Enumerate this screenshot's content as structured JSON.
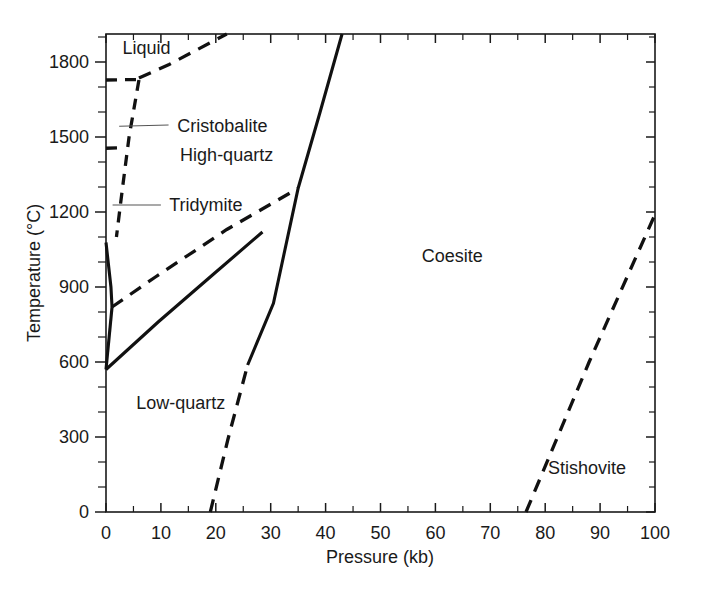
{
  "chart_data": {
    "type": "line",
    "title": "",
    "xlabel": "Pressure (kb)",
    "ylabel": "Temperature (°C)",
    "xlim": [
      0,
      100
    ],
    "ylim": [
      0,
      1912
    ],
    "grid": false,
    "legend": "none",
    "x_ticks": [
      0,
      10,
      20,
      30,
      40,
      50,
      60,
      70,
      80,
      90,
      100
    ],
    "x_tick_labels": [
      "0",
      "10",
      "20",
      "30",
      "40",
      "50",
      "60",
      "70",
      "80",
      "90",
      "100"
    ],
    "x_minor_step": 5,
    "y_ticks": [
      0,
      300,
      600,
      900,
      1200,
      1500,
      1800
    ],
    "y_tick_labels": [
      "0",
      "300",
      "600",
      "900",
      "1200",
      "1500",
      "1800"
    ],
    "y_minor_step": 100,
    "field_labels": [
      {
        "name": "Liquid",
        "text": "Liquid",
        "x": 3.0,
        "y": 1855
      },
      {
        "name": "Cristobalite",
        "text": "Cristobalite",
        "x": 13.0,
        "y": 1543
      },
      {
        "name": "High-quartz",
        "text": "High-quartz",
        "x": 13.5,
        "y": 1430
      },
      {
        "name": "Tridymite",
        "text": "Tridymite",
        "x": 11.5,
        "y": 1228
      },
      {
        "name": "Low-quartz",
        "text": "Low-quartz",
        "x": 5.5,
        "y": 435
      },
      {
        "name": "Coesite",
        "text": "Coesite",
        "x": 57.5,
        "y": 1025
      },
      {
        "name": "Stishovite",
        "text": "Stishovite",
        "x": 80.5,
        "y": 175
      }
    ],
    "series": [
      {
        "name": "liquidus-cristobalite",
        "style": "dashed",
        "points": [
          [
            6.0,
            1736
          ],
          [
            11.5,
            1790
          ],
          [
            22.0,
            1912
          ]
        ]
      },
      {
        "name": "cristobalite-liquid-flat",
        "style": "dashed",
        "points": [
          [
            0.0,
            1728
          ],
          [
            6.0,
            1730
          ]
        ]
      },
      {
        "name": "cristobalite-highquartz",
        "style": "dashed",
        "points": [
          [
            6.0,
            1728
          ],
          [
            4.2,
            1500
          ],
          [
            3.0,
            1295
          ],
          [
            1.9,
            1100
          ]
        ]
      },
      {
        "name": "tridymite-cristobalite-flat",
        "style": "dashed",
        "points": [
          [
            0.0,
            1455
          ],
          [
            3.4,
            1458
          ]
        ]
      },
      {
        "name": "highquartz-lowquartz-solid",
        "style": "solid",
        "points": [
          [
            0.0,
            1078
          ],
          [
            0.9,
            900
          ],
          [
            1.1,
            820
          ]
        ]
      },
      {
        "name": "tridymite-highquartz",
        "style": "dashed",
        "points": [
          [
            1.1,
            820
          ],
          [
            9.0,
            940
          ],
          [
            22.0,
            1130
          ],
          [
            35.0,
            1295
          ]
        ]
      },
      {
        "name": "lowquartz-highquartz-solid",
        "style": "solid",
        "points": [
          [
            0.0,
            570
          ],
          [
            1.1,
            820
          ]
        ]
      },
      {
        "name": "lowquartz-tridymite-solid",
        "style": "solid",
        "points": [
          [
            0.0,
            570
          ],
          [
            9.5,
            760
          ],
          [
            19.5,
            950
          ],
          [
            28.5,
            1120
          ]
        ]
      },
      {
        "name": "quartz-coesite-solid",
        "style": "solid",
        "points": [
          [
            25.8,
            588
          ],
          [
            30.5,
            835
          ],
          [
            35.0,
            1295
          ],
          [
            39.0,
            1600
          ],
          [
            43.0,
            1912
          ]
        ]
      },
      {
        "name": "quartz-coesite-dashed",
        "style": "dashed",
        "points": [
          [
            19.0,
            0
          ],
          [
            22.2,
            290
          ],
          [
            25.8,
            588
          ]
        ]
      },
      {
        "name": "coesite-stishovite",
        "style": "dashed",
        "points": [
          [
            76.5,
            0
          ],
          [
            88.0,
            600
          ],
          [
            100.0,
            1190
          ]
        ]
      }
    ],
    "leader_lines": [
      {
        "name": "cristobalite-leader",
        "x1": 2.4,
        "y1": 1543,
        "x2": 11.4,
        "y2": 1548
      },
      {
        "name": "tridymite-leader",
        "x1": 1.2,
        "y1": 1228,
        "x2": 10.0,
        "y2": 1228
      }
    ]
  }
}
